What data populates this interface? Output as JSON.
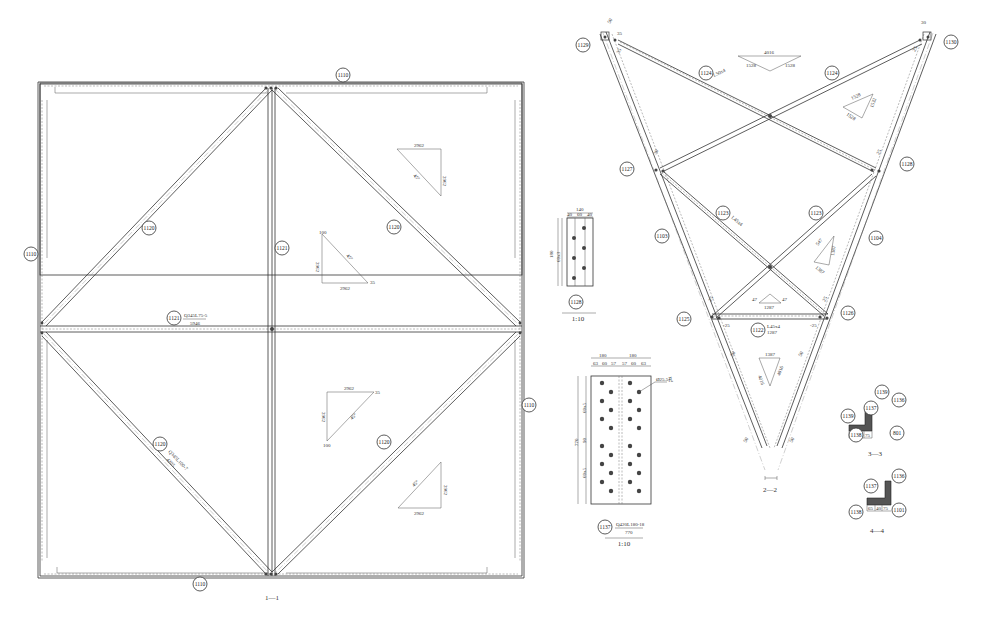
{
  "view_1_1": {
    "title": "1—1",
    "tags": {
      "top_chord": "1110",
      "bottom_chord": "1110",
      "left_chord": "1110",
      "right_chord": "1110",
      "diag_upper_left": "1120",
      "diag_upper_right": "1120",
      "diag_lower_left": "1120",
      "diag_lower_right": "1120",
      "vertical_post": "1121",
      "mid_horizontal": "1121"
    },
    "mid_horizontal_spec": "Q345L75-5",
    "mid_horizontal_length": "5946",
    "diag_lower_left_spec": "Q345L100-7",
    "diag_lower_left_length": "4205",
    "slope_triangles": [
      {
        "top": "2962",
        "side": "2962",
        "hyp": "45°"
      },
      {
        "side": "2962",
        "bottom": "2962",
        "hyp": "45°",
        "corner_a": "100",
        "corner_b": "35"
      },
      {
        "top": "2962",
        "side": "2962",
        "hyp": "45°",
        "corner_a": "35",
        "corner_b": "100"
      },
      {
        "side": "2962",
        "bottom": "2962",
        "hyp": "45°"
      }
    ]
  },
  "view_2_2": {
    "title": "2—2",
    "tags": {
      "top_left_node": "1129",
      "top_right_node": "1130",
      "mid_left_node": "1127",
      "mid_right_node": "1128",
      "low_left_node": "1125",
      "low_right_node": "1126",
      "upper_cross_left": "1124",
      "upper_cross_right": "1124",
      "lower_cross_left": "1123",
      "lower_cross_right": "1123",
      "left_leg": "1103",
      "right_leg": "1104",
      "bottom_strut": "1122"
    },
    "upper_cross_spec": "L50x4",
    "lower_cross_spec": "L45x4",
    "bottom_strut_spec": "L45x4",
    "bottom_strut_length": "1287",
    "dims": [
      "50",
      "30",
      "35",
      "35",
      "25",
      "30",
      "25",
      "25",
      "25",
      "50",
      "50",
      "-25",
      "-25",
      "50",
      "50"
    ],
    "slope_triangles": [
      {
        "top": "4016",
        "left": "1528",
        "right": "1528"
      },
      {
        "a": "1528",
        "b": "1528",
        "c": "1532"
      },
      {
        "a": "547",
        "b": "1387",
        "c": "1387"
      },
      {
        "top": "1287",
        "left": "47",
        "right": "47"
      },
      {
        "top": "1387",
        "left": "4016",
        "right": "4016"
      }
    ]
  },
  "plate_1128": {
    "tag": "1128",
    "scale": "1:10",
    "width_total": "140",
    "width_parts": [
      "40",
      "60",
      "40"
    ],
    "height_total": "180",
    "height_parts": [
      "40",
      "60x3",
      "40"
    ]
  },
  "plate_1137": {
    "tag": "1137",
    "spec": "Q420L180-18",
    "length": "770",
    "scale": "1:10",
    "width_groups": [
      "180",
      "180"
    ],
    "width_parts": [
      "63",
      "60",
      "57",
      "57",
      "60",
      "63"
    ],
    "height_total": "770",
    "height_parts": [
      "40",
      "60x5",
      "90",
      "60x5",
      "40"
    ],
    "hole_note": "Ø25.5孔"
  },
  "section_3_3": {
    "title": "3—3",
    "tags": [
      "1139",
      "1136",
      "1137",
      "1139",
      "1138",
      "801"
    ],
    "dims": [
      "65",
      "40",
      "75"
    ]
  },
  "section_4_4": {
    "title": "4—4",
    "tags": [
      "1136",
      "1137",
      "1138",
      "1101"
    ],
    "dims": [
      "65",
      "40",
      "75"
    ]
  }
}
